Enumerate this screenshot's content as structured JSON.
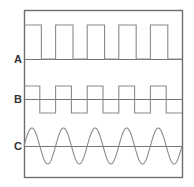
{
  "figure": {
    "background_color": "#ffffff",
    "frame": {
      "x": 24,
      "y": 10,
      "width": 158,
      "height": 167,
      "stroke_color": "#6e6e6e",
      "stroke_width": 1.4
    },
    "label_color": "#333333",
    "trace_color": "#8a8a8a",
    "baseline_color": "#777777"
  },
  "traces": [
    {
      "id": "A",
      "label": "A",
      "type": "pulse-train",
      "label_x": 14,
      "baseline_y": 59,
      "high_y": 25,
      "low_y": 59,
      "cycles": 5,
      "duty_percent": 55,
      "starts_high": true,
      "description": "Narrow positive pulse train, five pulses, rests on baseline"
    },
    {
      "id": "B",
      "label": "B",
      "type": "square-wave",
      "label_x": 14,
      "baseline_y": 99,
      "high_y": 86,
      "low_y": 113,
      "cycles": 5,
      "duty_percent": 50,
      "starts_high": true,
      "description": "Symmetric square wave swinging equally above and below baseline"
    },
    {
      "id": "C",
      "label": "C",
      "type": "sine-wave",
      "label_x": 14,
      "baseline_y": 146,
      "amplitude": 18,
      "cycles": 5,
      "phase": 0,
      "description": "Sinusoid of five cycles centred on baseline"
    }
  ]
}
